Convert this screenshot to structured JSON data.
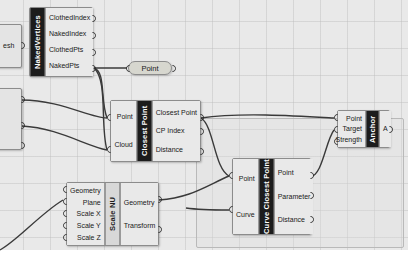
{
  "app": {
    "name": "Grasshopper Canvas",
    "canvas_background": "#e9e9e9",
    "grid_color": "#bebebe",
    "wire_color": "#3a3a3a"
  },
  "components": [
    {
      "id": "mesh-source",
      "title": "",
      "inputs": [
        "esh"
      ],
      "outputs": [],
      "partially_visible": true
    },
    {
      "id": "naked-vertices",
      "title": "NakedVertices",
      "title_style": "dark",
      "inputs": [],
      "outputs": [
        "ClothedIndex",
        "NakedIndex",
        "ClothedPts",
        "NakedPts"
      ]
    },
    {
      "id": "left-clip-component",
      "title": "",
      "inputs": [],
      "outputs": [
        "",
        "",
        ""
      ],
      "partially_visible": true
    },
    {
      "id": "closest-point",
      "title": "Closest Point",
      "title_style": "dark",
      "inputs": [
        "Point",
        "Cloud"
      ],
      "outputs": [
        "Closest Point",
        "CP Index",
        "Distance"
      ]
    },
    {
      "id": "curve-closest-point",
      "title": "Curve Closest Point",
      "title_style": "dark",
      "inputs": [
        "Point",
        "Curve"
      ],
      "outputs": [
        "Point",
        "Parameter",
        "Distance"
      ]
    },
    {
      "id": "anchor",
      "title": "Anchor",
      "title_style": "dark",
      "inputs": [
        "Point",
        "Target",
        "Strength"
      ],
      "outputs": [
        "A"
      ]
    },
    {
      "id": "scale-nu",
      "title": "Scale NU",
      "title_style": "light",
      "inputs": [
        "Geometry",
        "Plane",
        "Scale X",
        "Scale Y",
        "Scale Z"
      ],
      "outputs": [
        "Geometry",
        "Transform"
      ]
    }
  ],
  "params": [
    {
      "id": "point-param",
      "label": "Point"
    }
  ],
  "labels": {
    "naked_vertices_title": "NakedVertices",
    "nv_out_0": "ClothedIndex",
    "nv_out_1": "NakedIndex",
    "nv_out_2": "ClothedPts",
    "nv_out_3": "NakedPts",
    "mesh_input": "esh",
    "point_param": "Point",
    "cp_title": "Closest Point",
    "cp_in_0": "Point",
    "cp_in_1": "Cloud",
    "cp_out_0": "Closest Point",
    "cp_out_1": "CP Index",
    "cp_out_2": "Distance",
    "ccp_title": "Curve Closest Point",
    "ccp_in_0": "Point",
    "ccp_in_1": "Curve",
    "ccp_out_0": "Point",
    "ccp_out_1": "Parameter",
    "ccp_out_2": "Distance",
    "anchor_title": "Anchor",
    "anchor_in_0": "Point",
    "anchor_in_1": "Target",
    "anchor_in_2": "Strength",
    "anchor_out_0": "A",
    "scale_title": "Scale NU",
    "scale_in_0": "Geometry",
    "scale_in_1": "Plane",
    "scale_in_2": "Scale X",
    "scale_in_3": "Scale Y",
    "scale_in_4": "Scale Z",
    "scale_out_0": "Geometry",
    "scale_out_1": "Transform"
  }
}
